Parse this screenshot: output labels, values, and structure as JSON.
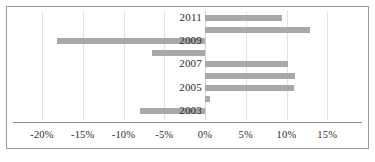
{
  "chart_data": {
    "type": "bar",
    "orientation": "horizontal",
    "title": "",
    "subtitle": "",
    "xlabel": "",
    "ylabel": "",
    "categories": [
      "2003",
      "2004",
      "2005",
      "2006",
      "2007",
      "2008",
      "2009",
      "2010",
      "2011"
    ],
    "values": [
      -8.0,
      0.6,
      10.9,
      11.0,
      10.2,
      -6.5,
      -18.2,
      12.9,
      9.5
    ],
    "series": [
      {
        "name": "annual change",
        "values": [
          -8.0,
          0.6,
          10.9,
          11.0,
          10.2,
          -6.5,
          -18.2,
          12.9,
          9.5
        ]
      }
    ],
    "bar_color": "#a8a8a8",
    "xlim": [
      -22.5,
      17.5
    ],
    "ylim": [
      0,
      9
    ],
    "xticks": [
      -20,
      -15,
      -10,
      -5,
      0,
      5,
      10,
      15
    ],
    "xtick_labels": [
      "-20%",
      "-15%",
      "-10%",
      "-5%",
      "0%",
      "5%",
      "10%",
      "15%"
    ],
    "ytick_labels": [
      "2003",
      "2005",
      "2007",
      "2009",
      "2011"
    ],
    "ytick_values": [
      2003,
      2005,
      2007,
      2009,
      2011
    ],
    "grid": true,
    "grid_axis": "x",
    "gridline_color": "#e2e2e2",
    "zero_line_color": "#d2d2d2",
    "legend": false,
    "legend_position": "none",
    "axis_line_color": "#8f8f8f",
    "border_color": "#9b9b9b",
    "background_color": "#ffffff",
    "annotations": []
  },
  "axis": {
    "x_ticks": [
      {
        "label": "-20%",
        "value": -20
      },
      {
        "label": "-15%",
        "value": -15
      },
      {
        "label": "-10%",
        "value": -10
      },
      {
        "label": "-5%",
        "value": -5
      },
      {
        "label": "0%",
        "value": 0
      },
      {
        "label": "5%",
        "value": 5
      },
      {
        "label": "10%",
        "value": 10
      },
      {
        "label": "15%",
        "value": 15
      }
    ],
    "y_ticks": [
      {
        "label": "2011",
        "value": 2011
      },
      {
        "label": "2009",
        "value": 2009
      },
      {
        "label": "2007",
        "value": 2007
      },
      {
        "label": "2005",
        "value": 2005
      },
      {
        "label": "2003",
        "value": 2003
      }
    ]
  },
  "bars": [
    {
      "category": "2011",
      "value": 9.5
    },
    {
      "category": "2010",
      "value": 12.9
    },
    {
      "category": "2009",
      "value": -18.2
    },
    {
      "category": "2008",
      "value": -6.5
    },
    {
      "category": "2007",
      "value": 10.2
    },
    {
      "category": "2006",
      "value": 11.0
    },
    {
      "category": "2005",
      "value": 10.9
    },
    {
      "category": "2004",
      "value": 0.6
    },
    {
      "category": "2003",
      "value": -8.0
    }
  ]
}
